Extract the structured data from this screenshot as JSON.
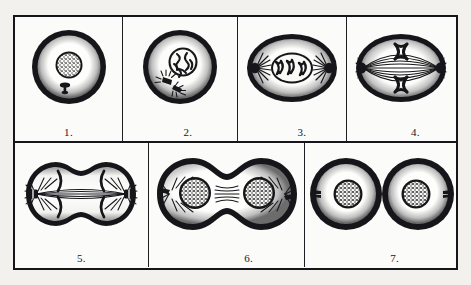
{
  "figure": {
    "style": "black-and-white engraved line art",
    "ink_color": "#16161a",
    "paper_color": "#fbfbf9",
    "page_background": "#f2f1ee",
    "frame": {
      "border_color": "#16161a",
      "divider_color": "#1d1d22"
    },
    "rows": [
      {
        "name": "top-row",
        "panel_count": 4
      },
      {
        "name": "bottom-row",
        "panel_count": 3
      }
    ]
  },
  "panels": [
    {
      "number": "1.",
      "name": "interphase",
      "shape": "circle",
      "description": "Round cell with thick dark membrane, large stippled nucleus at center, single small dark centriole below nucleus."
    },
    {
      "number": "2.",
      "name": "prophase",
      "shape": "circle",
      "description": "Round cell, nucleus containing tangled condensing chromosomes, pair of centrioles with short aster rays at lower left."
    },
    {
      "number": "3.",
      "name": "prometaphase",
      "shape": "oval",
      "description": "Oval cell, nuclear envelope still visible enclosing X-shaped chromosomes, two dark centrosomes with radiating asters at left and right poles."
    },
    {
      "number": "4.",
      "name": "metaphase",
      "shape": "oval",
      "description": "Oval cell with full spindle of fibres pole to pole, two X-shaped chromosomes aligned on the equatorial plate."
    },
    {
      "number": "5.",
      "name": "anaphase",
      "shape": "peanut",
      "description": "Elongated peanut-shaped cell with cleavage furrow forming, spindle fibres stretched between poles, chromosome groups drawn toward each pole."
    },
    {
      "number": "6.",
      "name": "telophase",
      "shape": "double-lobe",
      "description": "Two nearly separated daughter lobes, each with a newly reformed stippled nucleus, remnant spindle fibres across the narrow bridge."
    },
    {
      "number": "7.",
      "name": "cytokinesis-complete",
      "shape": "two-circles",
      "description": "Two fully separated round daughter cells, each with thick membrane and a stippled nucleus with a small centriole beside it."
    }
  ]
}
